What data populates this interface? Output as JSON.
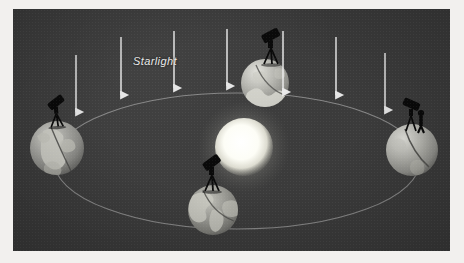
{
  "figure": {
    "domain": "diagram",
    "background_color": "#3b3b3b",
    "plate": {
      "x": 13,
      "y": 9,
      "width": 437,
      "height": 242
    },
    "page_color": "#f2f0ee"
  },
  "labels": {
    "starlight": "Starlight"
  },
  "colors": {
    "sky": "#3b3b3b",
    "orbit": "#8d8d8d",
    "arrow": "#efefef",
    "sun_core": "#ffffff",
    "sun_glow": "#fbfbf2",
    "earth_ocean": "#8f8f8f",
    "earth_land": "#cfcfc8",
    "telescope": "#0a0a0a",
    "label_text": "#e9e9e9"
  },
  "sun": {
    "name": "Sun",
    "cx": 231,
    "cy": 138,
    "r": 29,
    "glow_r": 46
  },
  "orbit": {
    "name": "Earth orbit ellipse",
    "cx": 224,
    "cy": 152,
    "rx": 183,
    "ry": 68,
    "stroke_width": 1.1
  },
  "earths": [
    {
      "id": "earth-left",
      "position_label": "left",
      "cx": 44,
      "cy": 139,
      "r": 27,
      "continents": "Africa and Europe",
      "telescope": {
        "x": 37,
        "y": 100,
        "rotate": -32,
        "has_observer": false
      }
    },
    {
      "id": "earth-top",
      "position_label": "top",
      "cx": 252,
      "cy": 74,
      "r": 24,
      "continents": "Antarctica limb",
      "telescope": {
        "x": 252,
        "y": 35,
        "rotate": -26,
        "has_observer": false
      }
    },
    {
      "id": "earth-bottom",
      "position_label": "bottom",
      "cx": 200,
      "cy": 201,
      "r": 25,
      "continents": "North and South America",
      "telescope": {
        "x": 193,
        "y": 161,
        "rotate": -34,
        "has_observer": false
      }
    },
    {
      "id": "earth-right",
      "position_label": "right",
      "cx": 399,
      "cy": 141,
      "r": 26,
      "continents": "Pacific limb",
      "telescope": {
        "x": 396,
        "y": 100,
        "rotate": 22,
        "has_observer": true
      }
    }
  ],
  "starlight_arrows": [
    {
      "id": "arrow-1",
      "x": 63,
      "y1": 46,
      "y2": 103
    },
    {
      "id": "arrow-2",
      "x": 108,
      "y1": 28,
      "y2": 86
    },
    {
      "id": "arrow-3",
      "x": 161,
      "y1": 22,
      "y2": 79
    },
    {
      "id": "arrow-4",
      "x": 214,
      "y1": 20,
      "y2": 77
    },
    {
      "id": "arrow-5",
      "x": 270,
      "y1": 22,
      "y2": 83
    },
    {
      "id": "arrow-6",
      "x": 323,
      "y1": 28,
      "y2": 86
    },
    {
      "id": "arrow-7",
      "x": 372,
      "y1": 44,
      "y2": 101
    }
  ],
  "starlight_label_position": {
    "x": 120,
    "y": 52
  },
  "tilt_axes": [
    {
      "id": "axis-left",
      "note": "rotation axis line on left Earth"
    },
    {
      "id": "axis-top",
      "note": "rotation axis line on top Earth"
    },
    {
      "id": "axis-bottom",
      "note": "rotation axis line on bottom Earth"
    },
    {
      "id": "axis-right",
      "note": "rotation axis line on right Earth"
    }
  ]
}
